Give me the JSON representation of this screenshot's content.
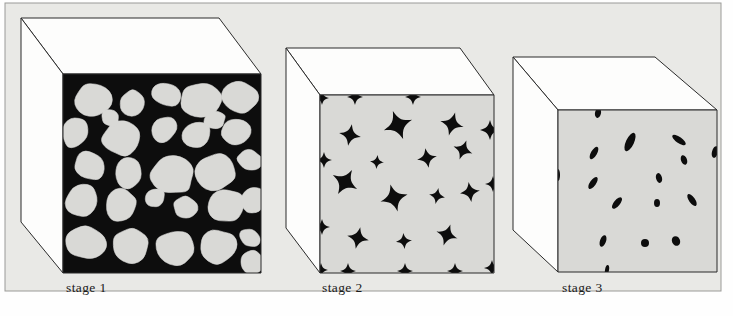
{
  "figure": {
    "background_color": "#e9e9e6",
    "page_color": "#fefefe",
    "frame_border_color": "#9a9a97",
    "cube_outline_color": "#2b2b2b",
    "cube_top_face_color": "#fdfdfc",
    "cube_left_face_color": "#fdfdfc",
    "matrix_dark_color": "#0d0d0d",
    "matrix_light_color": "#d9d9d6",
    "caption_color": "#1a1a1a"
  },
  "stages": [
    {
      "id": "stage-1",
      "label": "stage 1",
      "caption_x": 66,
      "caption_y": 292,
      "front_face_fill": "#0d0d0d",
      "particle_fill": "#d9d9d6",
      "description": "densely packed rounded particles with dark pore network",
      "geometry": {
        "front": [
          [
            63,
            74
          ],
          [
            261,
            74
          ],
          [
            261,
            273
          ],
          [
            63,
            273
          ]
        ],
        "top": [
          [
            63,
            74
          ],
          [
            21,
            18
          ],
          [
            219,
            18
          ],
          [
            261,
            74
          ]
        ],
        "left": [
          [
            63,
            74
          ],
          [
            21,
            18
          ],
          [
            21,
            222
          ],
          [
            63,
            273
          ]
        ]
      },
      "particles": [
        {
          "cx": 92,
          "cy": 100,
          "rx": 20,
          "ry": 17,
          "rot": -15
        },
        {
          "cx": 132,
          "cy": 103,
          "rx": 13,
          "ry": 13,
          "rot": 10
        },
        {
          "cx": 166,
          "cy": 94,
          "rx": 16,
          "ry": 12,
          "rot": 25
        },
        {
          "cx": 201,
          "cy": 100,
          "rx": 21,
          "ry": 18,
          "rot": -8
        },
        {
          "cx": 240,
          "cy": 97,
          "rx": 18,
          "ry": 16,
          "rot": 12
        },
        {
          "cx": 75,
          "cy": 133,
          "rx": 13,
          "ry": 16,
          "rot": 20
        },
        {
          "cx": 122,
          "cy": 138,
          "rx": 20,
          "ry": 18,
          "rot": -20
        },
        {
          "cx": 164,
          "cy": 130,
          "rx": 12,
          "ry": 15,
          "rot": 35
        },
        {
          "cx": 196,
          "cy": 135,
          "rx": 15,
          "ry": 13,
          "rot": -30
        },
        {
          "cx": 236,
          "cy": 132,
          "rx": 16,
          "ry": 14,
          "rot": 5
        },
        {
          "cx": 90,
          "cy": 165,
          "rx": 17,
          "ry": 14,
          "rot": 30
        },
        {
          "cx": 128,
          "cy": 172,
          "rx": 14,
          "ry": 16,
          "rot": -10
        },
        {
          "cx": 172,
          "cy": 175,
          "rx": 22,
          "ry": 20,
          "rot": 15
        },
        {
          "cx": 216,
          "cy": 172,
          "rx": 21,
          "ry": 19,
          "rot": -12
        },
        {
          "cx": 250,
          "cy": 160,
          "rx": 13,
          "ry": 10,
          "rot": 20
        },
        {
          "cx": 82,
          "cy": 200,
          "rx": 18,
          "ry": 16,
          "rot": -25
        },
        {
          "cx": 121,
          "cy": 205,
          "rx": 15,
          "ry": 17,
          "rot": 18
        },
        {
          "cx": 155,
          "cy": 198,
          "rx": 11,
          "ry": 9,
          "rot": -35
        },
        {
          "cx": 186,
          "cy": 208,
          "rx": 13,
          "ry": 12,
          "rot": 8
        },
        {
          "cx": 226,
          "cy": 205,
          "rx": 19,
          "ry": 17,
          "rot": -5
        },
        {
          "cx": 253,
          "cy": 200,
          "rx": 12,
          "ry": 15,
          "rot": 22
        },
        {
          "cx": 86,
          "cy": 243,
          "rx": 20,
          "ry": 17,
          "rot": 10
        },
        {
          "cx": 130,
          "cy": 245,
          "rx": 19,
          "ry": 18,
          "rot": -18
        },
        {
          "cx": 176,
          "cy": 248,
          "rx": 20,
          "ry": 18,
          "rot": 12
        },
        {
          "cx": 218,
          "cy": 247,
          "rx": 19,
          "ry": 17,
          "rot": -8
        },
        {
          "cx": 250,
          "cy": 238,
          "rx": 11,
          "ry": 9,
          "rot": 25
        },
        {
          "cx": 252,
          "cy": 262,
          "rx": 13,
          "ry": 12,
          "rot": -15
        },
        {
          "cx": 110,
          "cy": 118,
          "rx": 10,
          "ry": 8,
          "rot": 40
        },
        {
          "cx": 215,
          "cy": 120,
          "rx": 11,
          "ry": 9,
          "rot": -22
        }
      ]
    },
    {
      "id": "stage-2",
      "label": "stage 2",
      "caption_x": 322,
      "caption_y": 292,
      "front_face_fill": "#d9d9d6",
      "particle_fill": "#0d0d0d",
      "description": "sintered matrix with angular concave residual pores at grain junctions",
      "geometry": {
        "front": [
          [
            320,
            95
          ],
          [
            494,
            95
          ],
          [
            494,
            273
          ],
          [
            320,
            273
          ]
        ],
        "top": [
          [
            320,
            95
          ],
          [
            286,
            48
          ],
          [
            460,
            48
          ],
          [
            494,
            95
          ]
        ],
        "left": [
          [
            320,
            95
          ],
          [
            286,
            48
          ],
          [
            286,
            228
          ],
          [
            320,
            273
          ]
        ]
      },
      "pores": [
        {
          "cx": 350,
          "cy": 135,
          "r": 11,
          "rot": 10
        },
        {
          "cx": 398,
          "cy": 125,
          "r": 15,
          "rot": -20
        },
        {
          "cx": 452,
          "cy": 124,
          "r": 12,
          "rot": 15
        },
        {
          "cx": 490,
          "cy": 130,
          "r": 10,
          "rot": 0
        },
        {
          "cx": 377,
          "cy": 162,
          "r": 7,
          "rot": 5
        },
        {
          "cx": 427,
          "cy": 158,
          "r": 10,
          "rot": -10
        },
        {
          "cx": 463,
          "cy": 150,
          "r": 10,
          "rot": 20
        },
        {
          "cx": 324,
          "cy": 160,
          "r": 8,
          "rot": 0
        },
        {
          "cx": 345,
          "cy": 182,
          "r": 14,
          "rot": 30
        },
        {
          "cx": 394,
          "cy": 198,
          "r": 14,
          "rot": -15
        },
        {
          "cx": 437,
          "cy": 196,
          "r": 8,
          "rot": 10
        },
        {
          "cx": 470,
          "cy": 192,
          "r": 10,
          "rot": -8
        },
        {
          "cx": 493,
          "cy": 184,
          "r": 8,
          "rot": 0
        },
        {
          "cx": 358,
          "cy": 238,
          "r": 11,
          "rot": 12
        },
        {
          "cx": 404,
          "cy": 241,
          "r": 8,
          "rot": -5
        },
        {
          "cx": 447,
          "cy": 235,
          "r": 11,
          "rot": 18
        },
        {
          "cx": 322,
          "cy": 227,
          "r": 8,
          "rot": 0
        },
        {
          "cx": 355,
          "cy": 97,
          "r": 8,
          "rot": 0
        },
        {
          "cx": 413,
          "cy": 97,
          "r": 8,
          "rot": 0
        },
        {
          "cx": 322,
          "cy": 98,
          "r": 7,
          "rot": 0
        },
        {
          "cx": 348,
          "cy": 271,
          "r": 8,
          "rot": 0
        },
        {
          "cx": 405,
          "cy": 271,
          "r": 8,
          "rot": 0
        },
        {
          "cx": 455,
          "cy": 271,
          "r": 8,
          "rot": 0
        },
        {
          "cx": 492,
          "cy": 268,
          "r": 8,
          "rot": 0
        },
        {
          "cx": 321,
          "cy": 270,
          "r": 7,
          "rot": 0
        }
      ]
    },
    {
      "id": "stage-3",
      "label": "stage 3",
      "caption_x": 562,
      "caption_y": 292,
      "front_face_fill": "#d9d9d6",
      "particle_fill": "#0d0d0d",
      "description": "nearly dense matrix with few small isolated spheroidized pores",
      "geometry": {
        "front": [
          [
            558,
            110
          ],
          [
            717,
            110
          ],
          [
            717,
            272
          ],
          [
            558,
            272
          ]
        ],
        "top": [
          [
            558,
            110
          ],
          [
            513,
            57
          ],
          [
            655,
            57
          ],
          [
            717,
            110
          ]
        ],
        "left": [
          [
            558,
            110
          ],
          [
            513,
            57
          ],
          [
            513,
            230
          ],
          [
            558,
            272
          ]
        ]
      },
      "pores": [
        {
          "cx": 598,
          "cy": 113,
          "rx": 3,
          "ry": 5,
          "rot": 10
        },
        {
          "cx": 630,
          "cy": 142,
          "rx": 4,
          "ry": 10,
          "rot": 25
        },
        {
          "cx": 679,
          "cy": 140,
          "rx": 3,
          "ry": 8,
          "rot": -55
        },
        {
          "cx": 715,
          "cy": 152,
          "rx": 3,
          "ry": 6,
          "rot": 15
        },
        {
          "cx": 594,
          "cy": 153,
          "rx": 3,
          "ry": 7,
          "rot": 30
        },
        {
          "cx": 684,
          "cy": 160,
          "rx": 3,
          "ry": 5,
          "rot": -20
        },
        {
          "cx": 558,
          "cy": 175,
          "rx": 2,
          "ry": 6,
          "rot": 0
        },
        {
          "cx": 593,
          "cy": 183,
          "rx": 3,
          "ry": 7,
          "rot": 35
        },
        {
          "cx": 659,
          "cy": 178,
          "rx": 3,
          "ry": 5,
          "rot": -15
        },
        {
          "cx": 617,
          "cy": 203,
          "rx": 3,
          "ry": 7,
          "rot": 40
        },
        {
          "cx": 657,
          "cy": 203,
          "rx": 3,
          "ry": 4,
          "rot": 0
        },
        {
          "cx": 692,
          "cy": 200,
          "rx": 3,
          "ry": 7,
          "rot": -35
        },
        {
          "cx": 603,
          "cy": 241,
          "rx": 3,
          "ry": 6,
          "rot": 20
        },
        {
          "cx": 645,
          "cy": 243,
          "rx": 4,
          "ry": 4,
          "rot": 0
        },
        {
          "cx": 676,
          "cy": 241,
          "rx": 4,
          "ry": 5,
          "rot": -25
        },
        {
          "cx": 607,
          "cy": 270,
          "rx": 2,
          "ry": 5,
          "rot": 10
        }
      ]
    }
  ]
}
